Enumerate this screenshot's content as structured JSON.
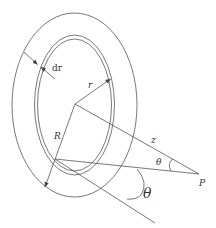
{
  "diagram": {
    "colors": {
      "stroke": "#555555",
      "background": "#ffffff",
      "text": "#333333"
    },
    "labels": {
      "dr": "dr",
      "r": "r",
      "R": "R",
      "z": "z",
      "theta_small": "θ",
      "theta_large": "θ",
      "P": "P"
    },
    "shapes": {
      "outer_ellipse": {
        "cx": 74.5,
        "cy": 105,
        "rx": 62.5,
        "ry": 92
      },
      "ring_outer": {
        "cx": 74.5,
        "cy": 105,
        "rx": 40,
        "ry": 70
      },
      "ring_inner": {
        "cx": 74.5,
        "cy": 105,
        "rx": 37,
        "ry": 66
      },
      "center": {
        "x": 75,
        "y": 104
      },
      "point_P": {
        "x": 199,
        "y": 174
      },
      "ring_point": {
        "x": 55,
        "y": 159
      }
    }
  }
}
